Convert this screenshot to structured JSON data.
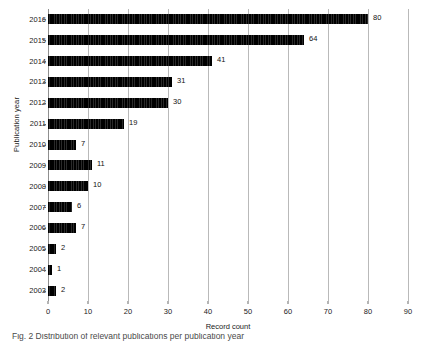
{
  "chart_data": {
    "type": "bar",
    "orientation": "horizontal",
    "title": "",
    "xlabel": "Record count",
    "ylabel": "Publication year",
    "categories": [
      "2016",
      "2015",
      "2014",
      "2013",
      "2012",
      "2011",
      "2010",
      "2009",
      "2008",
      "2007",
      "2006",
      "2005",
      "2004",
      "2003"
    ],
    "values": [
      80,
      64,
      41,
      31,
      30,
      19,
      7,
      11,
      10,
      6,
      7,
      2,
      1,
      2
    ],
    "xlim": [
      0,
      90
    ],
    "xticks": [
      0,
      10,
      20,
      30,
      40,
      50,
      60,
      70,
      80,
      90
    ],
    "grid": "vertical gridlines at each x tick",
    "legend": "none",
    "data_labels": [
      "80",
      "64",
      "41",
      "31",
      "30",
      "19",
      "7",
      "11",
      "10",
      "6",
      "7",
      "2",
      "1",
      "2"
    ],
    "bar_color": "#111111",
    "grid_color": "#b9b9b9",
    "background": "#ffffff"
  },
  "caption": {
    "text": "Fig. 2 Distribution of relevant publications per publication year",
    "note_visible": "clipped at bottom edge, only topmost pixel row rendered"
  }
}
